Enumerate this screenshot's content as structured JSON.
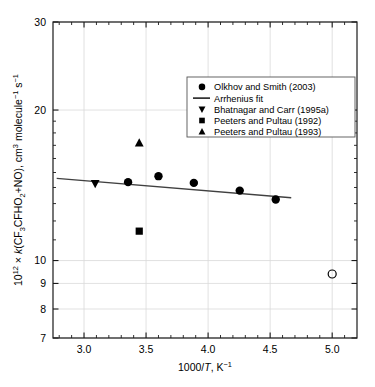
{
  "chart_data": {
    "type": "scatter",
    "title": "",
    "xlabel": "1000/T, K⁻¹",
    "ylabel": "10¹² × k(CF₃CFHO₂+NO), cm³ molecule⁻¹ s⁻¹",
    "xlim": [
      2.75,
      5.2
    ],
    "ylim": [
      7,
      30
    ],
    "yscale": "log",
    "xscale": "linear",
    "xticks": [
      3.0,
      3.5,
      4.0,
      4.5,
      5.0
    ],
    "xtick_labels": [
      "3.0",
      "3.5",
      "4.0",
      "4.5",
      "5.0"
    ],
    "xticks_minor": [
      2.8,
      2.9,
      3.1,
      3.2,
      3.3,
      3.4,
      3.6,
      3.7,
      3.8,
      3.9,
      4.1,
      4.2,
      4.3,
      4.4,
      4.6,
      4.7,
      4.8,
      4.9,
      5.1
    ],
    "yticks": [
      7,
      8,
      9,
      10,
      20,
      30
    ],
    "ytick_labels": [
      "7",
      "8",
      "9",
      "10",
      "20",
      "30"
    ],
    "grid": true,
    "grid_axis": "both",
    "legend_position": "upper right",
    "series": [
      {
        "name": "Olkhov and Smith (2003)",
        "marker": "filled-circle",
        "points": [
          {
            "x": 3.355,
            "y": 14.35
          },
          {
            "x": 3.6,
            "y": 14.75
          },
          {
            "x": 3.885,
            "y": 14.3
          },
          {
            "x": 4.255,
            "y": 13.8
          },
          {
            "x": 4.545,
            "y": 13.25
          }
        ]
      },
      {
        "name": "Arrhenius fit",
        "marker": "line",
        "line": [
          {
            "x": 2.78,
            "y": 14.6
          },
          {
            "x": 4.67,
            "y": 13.35
          }
        ]
      },
      {
        "name": "Bhatnagar and Carr (1995a)",
        "marker": "filled-down-triangle",
        "points": [
          {
            "x": 3.09,
            "y": 14.25
          }
        ]
      },
      {
        "name": "Peeters and Pultau (1992)",
        "marker": "filled-square",
        "points": [
          {
            "x": 3.445,
            "y": 11.45
          }
        ]
      },
      {
        "name": "Peeters and Pultau (1993)",
        "marker": "filled-up-triangle",
        "points": [
          {
            "x": 3.445,
            "y": 17.2
          }
        ]
      },
      {
        "name": "open-circle-datum",
        "marker": "open-circle",
        "points": [
          {
            "x": 5.0,
            "y": 9.4
          }
        ]
      }
    ]
  },
  "legend": {
    "entries": [
      {
        "label": "Olkhov and Smith (2003)",
        "marker": "filled-circle"
      },
      {
        "label": "Arrhenius fit",
        "marker": "line"
      },
      {
        "label": "Bhatnagar and Carr (1995a)",
        "marker": "filled-down-triangle"
      },
      {
        "label": "Peeters and Pultau (1992)",
        "marker": "filled-square"
      },
      {
        "label": "Peeters and Pultau (1993)",
        "marker": "filled-up-triangle"
      }
    ]
  },
  "axes": {
    "y_label_parts": {
      "prefix": "10",
      "prefix_exp": "12",
      "times": "×",
      "k": "k",
      "open": "(CF",
      "sub3": "3",
      "mid": "CFHO",
      "sub2": "2",
      "plus_no": "+NO), cm",
      "sup3": "3",
      "molecule": " molecule",
      "sup_m1": "−1",
      "s": " s",
      "sup_s1": "−1"
    },
    "x_label_parts": {
      "main": "1000/",
      "ital": "T",
      "comma": ", K",
      "sup": "−1"
    }
  },
  "colors": {
    "axis": "#1a1a1a",
    "grid": "#d9d9d9",
    "marker": "#000000",
    "fit_line": "#404040",
    "background": "#ffffff"
  }
}
